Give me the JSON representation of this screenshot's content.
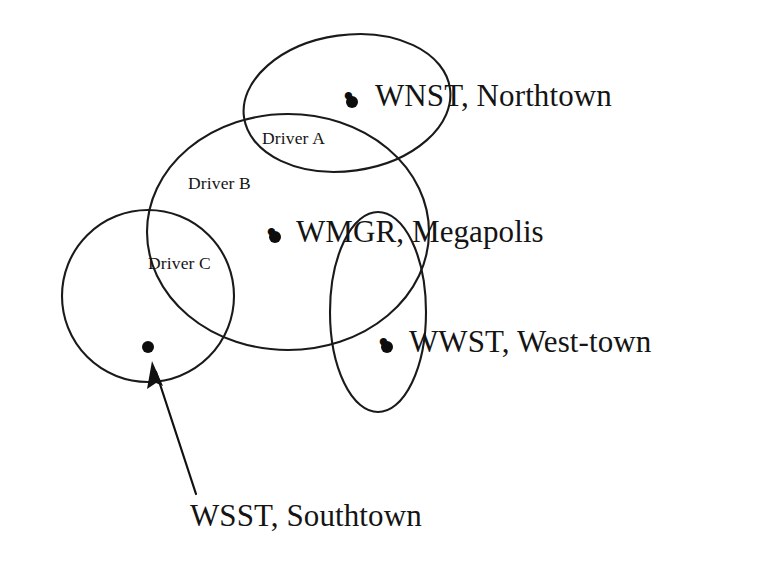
{
  "figure": {
    "kind": "venn-overlap-coverage-diagram",
    "background_color": "#ffffff",
    "line_color": "#1a1a1a"
  },
  "regions": [
    {
      "id": "driver-a",
      "label": "Driver A",
      "shape": "ellipse",
      "label_x": 262,
      "label_y": 130,
      "cx": 347,
      "cy": 103,
      "rx": 104,
      "ry": 68,
      "rotation": -8
    },
    {
      "id": "driver-b",
      "label": "Driver B",
      "shape": "ellipse",
      "label_x": 188,
      "label_y": 175,
      "cx": 288,
      "cy": 232,
      "rx": 141,
      "ry": 118,
      "rotation": 0
    },
    {
      "id": "driver-c",
      "label": "Driver C",
      "shape": "ellipse",
      "label_x": 148,
      "label_y": 255,
      "cx": 148,
      "cy": 296,
      "rx": 86,
      "ry": 86,
      "rotation": 0
    },
    {
      "id": "unlabeled-west-region",
      "label": "",
      "shape": "ellipse",
      "label_x": 0,
      "label_y": 0,
      "cx": 378,
      "cy": 312,
      "rx": 48,
      "ry": 100,
      "rotation": 0
    }
  ],
  "stations": [
    {
      "id": "wnst",
      "label": "WNST, Northtown",
      "bullet": "•",
      "dot_x": 352,
      "dot_y": 102,
      "bullet_x": 343,
      "bullet_y": 79,
      "label_x": 375,
      "label_y": 80
    },
    {
      "id": "wmgr",
      "label": "WMGR, Megapolis",
      "bullet": "•",
      "dot_x": 275,
      "dot_y": 237,
      "bullet_x": 266,
      "bullet_y": 215,
      "label_x": 296,
      "label_y": 216
    },
    {
      "id": "wwst",
      "label": "WWST, West-town",
      "bullet": "•",
      "dot_x": 387,
      "dot_y": 347,
      "bullet_x": 378,
      "bullet_y": 325,
      "label_x": 409,
      "label_y": 326
    },
    {
      "id": "wsst",
      "label": "WSST, Southtown",
      "bullet": "",
      "dot_x": 148,
      "dot_y": 347,
      "bullet_x": 0,
      "bullet_y": 0,
      "label_x": 190,
      "label_y": 500
    }
  ],
  "callout": {
    "id": "wsst-callout",
    "from_x": 196,
    "from_y": 494,
    "to_x": 152,
    "to_y": 362,
    "target_station": "wsst"
  }
}
